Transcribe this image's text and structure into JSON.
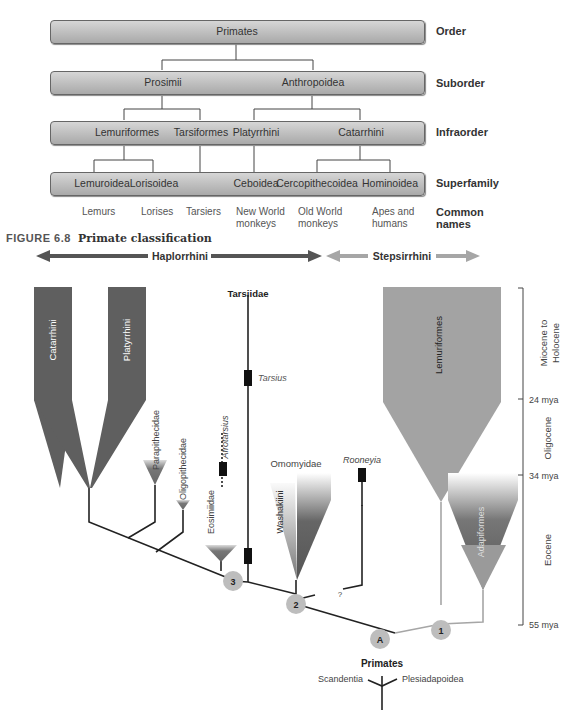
{
  "classification": {
    "ranks": [
      "Order",
      "Suborder",
      "Infraorder",
      "Superfamily",
      "Common names"
    ],
    "order": [
      "Primates"
    ],
    "suborder": [
      "Prosimii",
      "Anthropoidea"
    ],
    "infraorder": [
      "Lemuriformes",
      "Tarsiformes",
      "Platyrrhini",
      "Catarrhini"
    ],
    "superfamily": [
      "Lemuroidea",
      "Lorisoidea",
      "Ceboidea",
      "Cercopithecoidea",
      "Hominoidea"
    ],
    "common_names": [
      "Lemurs",
      "Lorises",
      "Tarsiers",
      "New World monkeys",
      "Old World monkeys",
      "Apes and humans"
    ]
  },
  "caption": {
    "figure_number": "FIGURE 6.8",
    "title": "Primate classification"
  },
  "phylogeny": {
    "groups": {
      "haplorrhini": "Haplorrhini",
      "strepsirrhini": "Stepsirrhini"
    },
    "colors": {
      "haplorrhini": "#555555",
      "strepsirrhini": "#a6a6a6",
      "lemuriformes_fill": "#a3a3a3",
      "anthropoid_fill": "#5f5f5f",
      "node_fill": "#bdbdbd"
    },
    "taxa": {
      "catarrhini": "Catarrhini",
      "platyrrhini": "Platyrrhini",
      "tarsiidae": "Tarsiidae",
      "tarsius": "Tarsius",
      "parapithecidae": "Parapithecidae",
      "oligopithecidae": "Oligopithecidae",
      "afrotarsius": "Afrotarsius",
      "eosimiidae": "Eosimiidae",
      "omomyidae": "Omomyidae",
      "washakiini": "Washakiini",
      "rooneyia": "Rooneyia",
      "lemuriformes": "Lemuriformes",
      "adapiformes": "Adapiformes",
      "primates": "Primates",
      "scandentia": "Scandentia",
      "plesiadapoidea": "Plesiadapoidea",
      "uncertain": "?"
    },
    "nodes": [
      "3",
      "2",
      "A",
      "1"
    ],
    "timescale": {
      "epochs": [
        "Miocene to",
        "Holocene",
        "Oligocene",
        "Eocene"
      ],
      "ticks": [
        "24 mya",
        "34 mya",
        "55 mya"
      ]
    }
  }
}
